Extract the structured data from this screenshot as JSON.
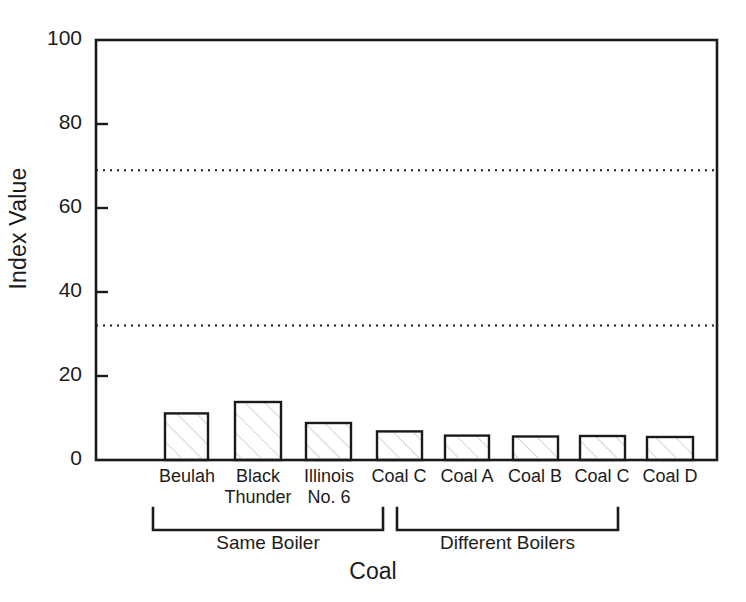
{
  "chart_data": {
    "type": "bar",
    "title": "",
    "xlabel": "Coal",
    "ylabel": "Index Value",
    "ylim": [
      0,
      100
    ],
    "yticks": [
      0,
      20,
      40,
      60,
      80,
      100
    ],
    "ytick_labels": [
      "0",
      "20",
      "40",
      "60",
      "80",
      "100"
    ],
    "grid": "horizontal dotted reference lines only",
    "legend": "none",
    "categories": [
      "Beulah",
      "Black\nThunder",
      "Illinois\nNo. 6",
      "Coal C",
      "Coal A",
      "Coal B",
      "Coal C",
      "Coal D"
    ],
    "values": [
      78.5,
      12.7,
      11.1,
      13.8,
      8.8,
      6.8,
      5.8,
      5.6
    ],
    "bar_style": {
      "fill": "#ffffff",
      "hatch": "diagonal-lines",
      "hatch_color": "#c9c9c9",
      "edge_color": "#1a1a1a"
    },
    "reference_lines": [
      {
        "value": 69.0,
        "style": "dotted",
        "color": "#1a1a1a"
      },
      {
        "value": 32.0,
        "style": "dotted",
        "color": "#1a1a1a"
      }
    ],
    "groups": [
      {
        "label": "Same Boiler",
        "members": [
          "Beulah",
          "Black Thunder",
          "Illinois No. 6",
          "Coal C"
        ]
      },
      {
        "label": "Different Boilers",
        "members": [
          "Coal A",
          "Coal B",
          "Coal C",
          "Coal D"
        ]
      }
    ]
  },
  "axes": {
    "y_title": "Index Value",
    "x_title": "Coal",
    "y_labels": [
      "100",
      "80",
      "60",
      "40",
      "20",
      "0"
    ]
  },
  "groups": {
    "same_boiler": "Same Boiler",
    "different_boilers": "Different Boilers"
  },
  "categories": {
    "c0": "Beulah",
    "c1_line1": "Black",
    "c1_line2": "Thunder",
    "c2_line1": "Illinois",
    "c2_line2": "No. 6",
    "c3": "Coal C",
    "c4": "Coal A",
    "c5": "Coal B",
    "c6": "Coal C",
    "c7": "Coal D"
  },
  "colors": {
    "axis": "#1a1a1a",
    "bar_edge": "#1a1a1a",
    "bar_fill": "#ffffff",
    "hatch": "#c9c9c9",
    "text": "#1c1c1c"
  }
}
